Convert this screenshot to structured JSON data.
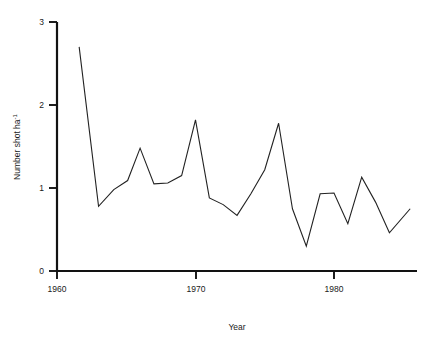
{
  "chart_data": {
    "type": "line",
    "title": "",
    "subtitle": "",
    "xlabel": "Year",
    "ylabel": "Number shot ha",
    "ylabel_superscript": "-1",
    "ylabel_full": "Number shot ha⁻¹",
    "xlim": [
      1960,
      1986.5
    ],
    "ylim": [
      0,
      3
    ],
    "x_ticks": [
      1960,
      1970,
      1980
    ],
    "x_tick_labels": [
      "1960",
      "1970",
      "1980"
    ],
    "y_ticks": [
      0,
      1,
      2,
      3
    ],
    "y_tick_labels": [
      "0",
      "1",
      "2",
      "3"
    ],
    "grid": false,
    "legend": false,
    "legend_position": "none",
    "line_color": "#222222",
    "axis_color": "#121212",
    "background_color": "#ffffff",
    "series": [
      {
        "name": "Number shot per hectare",
        "x": [
          1961.6,
          1963.0,
          1964.1,
          1965.1,
          1966.0,
          1967.0,
          1968.0,
          1969.0,
          1970.0,
          1971.0,
          1972.0,
          1973.0,
          1974.0,
          1975.0,
          1976.0,
          1977.0,
          1978.0,
          1979.0,
          1980.0,
          1981.0,
          1982.0,
          1983.0,
          1984.0,
          1985.5
        ],
        "values": [
          2.7,
          0.78,
          0.98,
          1.09,
          1.48,
          1.05,
          1.06,
          1.15,
          1.82,
          0.88,
          0.8,
          0.67,
          0.93,
          1.22,
          1.78,
          0.75,
          0.3,
          0.93,
          0.94,
          0.57,
          1.13,
          0.83,
          0.46,
          0.75
        ]
      }
    ]
  },
  "axis_titles": {
    "x": "Year",
    "y_main": "Number shot ha",
    "y_exponent": "-1"
  }
}
